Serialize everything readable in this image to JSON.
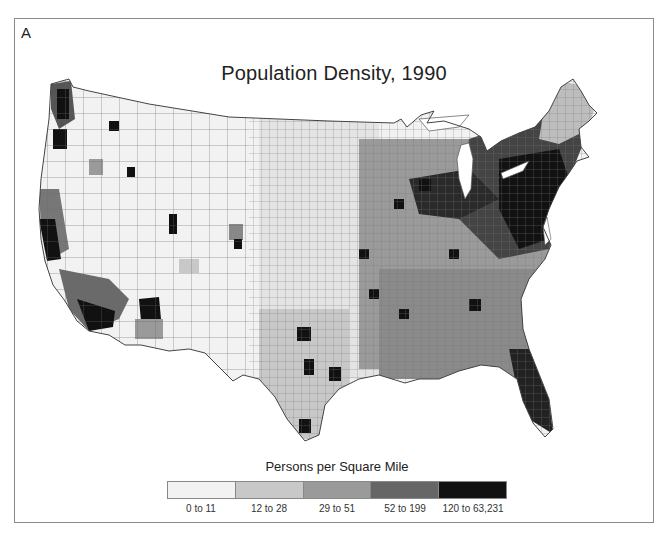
{
  "figure": {
    "panel_label": "A",
    "title": "Population Density, 1990"
  },
  "legend": {
    "title": "Persons per Square Mile",
    "classes": [
      {
        "label": "0 to 11",
        "color": "#f2f2f2"
      },
      {
        "label": "12 to 28",
        "color": "#c8c8c8"
      },
      {
        "label": "29 to 51",
        "color": "#9a9a9a"
      },
      {
        "label": "52 to 199",
        "color": "#666666"
      },
      {
        "label": "120 to 63,231",
        "color": "#121212"
      }
    ]
  },
  "map": {
    "region": "Contiguous United States, county level",
    "stroke_color": "#555555"
  }
}
